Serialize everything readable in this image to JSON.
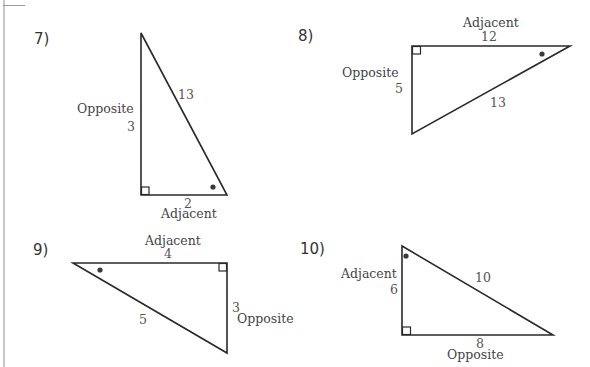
{
  "worksheet": {
    "problems": [
      {
        "number": "7)",
        "sides": {
          "opposite": {
            "label": "Opposite",
            "value": "3"
          },
          "adjacent": {
            "label": "Adjacent",
            "value": "2"
          },
          "hypotenuse": {
            "value": "13"
          }
        }
      },
      {
        "number": "8)",
        "sides": {
          "opposite": {
            "label": "Opposite",
            "value": "5"
          },
          "adjacent": {
            "label": "Adjacent",
            "value": "12"
          },
          "hypotenuse": {
            "value": "13"
          }
        }
      },
      {
        "number": "9)",
        "sides": {
          "opposite": {
            "label": "Opposite",
            "value": "3"
          },
          "adjacent": {
            "label": "Adjacent",
            "value": "4"
          },
          "hypotenuse": {
            "value": "5"
          }
        }
      },
      {
        "number": "10)",
        "sides": {
          "opposite": {
            "label": "Opposite",
            "value": "8"
          },
          "adjacent": {
            "label": "Adjacent",
            "value": "6"
          },
          "hypotenuse": {
            "value": "10"
          }
        }
      }
    ]
  },
  "colors": {
    "line": "#2a2a2a",
    "text": "#444444",
    "margin": "#c8c8c8"
  }
}
